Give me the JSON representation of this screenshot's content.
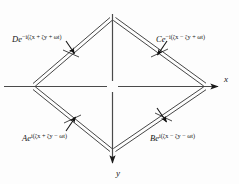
{
  "figure": {
    "background_color": "#fdfdfd",
    "ink_color": "#151515"
  },
  "axes": {
    "x": {
      "label": "x",
      "direction": "right",
      "arrow": true,
      "y_pixel": 86,
      "x_start": 4,
      "x_end": 222
    },
    "y": {
      "label": "y",
      "direction": "down",
      "arrow": true,
      "x_pixel": 112,
      "y_start": 14,
      "y_end": 166
    },
    "origin_gap": true
  },
  "waves": [
    {
      "id": "D",
      "amplitude": "De",
      "exponent_prefix": "−i(",
      "exponent": "−i(ζx + ζy + ωt)",
      "exponent_parts": {
        "sign": "−i(",
        "term1": "ζx",
        "op1": "+",
        "term2": "ζy",
        "op2": "+",
        "term3": "ωt",
        "close": ")"
      },
      "label_full": "De −i(ζx + ζy + ωt)",
      "quadrant": "top-left",
      "ray_from": [
        33,
        86
      ],
      "ray_to": [
        108,
        20
      ],
      "arrow_direction": "down-right",
      "arrow_at": [
        71,
        53
      ]
    },
    {
      "id": "C",
      "amplitude": "Ce",
      "exponent_prefix": "−i(",
      "exponent": "−i(ζx − ζy + ωt)",
      "exponent_parts": {
        "sign": "−i(",
        "term1": "ζx",
        "op1": "−",
        "term2": "ζy",
        "op2": "+",
        "term3": "ωt",
        "close": ")"
      },
      "label_full": "Ce −i(ζx − ζy + ωt)",
      "quadrant": "top-right",
      "ray_from": [
        117,
        20
      ],
      "ray_to": [
        205,
        86
      ],
      "arrow_direction": "down-left",
      "arrow_at": [
        159,
        52
      ]
    },
    {
      "id": "A",
      "amplitude": "Ae",
      "exponent_prefix": "i(",
      "exponent": "i(ζx + ζy − ωt)",
      "exponent_parts": {
        "sign": "i(",
        "term1": "ζx",
        "op1": "+",
        "term2": "ζy",
        "op2": "−",
        "term3": "ωt",
        "close": ")"
      },
      "label_full": "Ae i(ζx + ζy − ωt)",
      "quadrant": "bottom-left",
      "ray_from": [
        33,
        90
      ],
      "ray_to": [
        108,
        150
      ],
      "arrow_direction": "up-right",
      "arrow_at": [
        73,
        120
      ]
    },
    {
      "id": "B",
      "amplitude": "Be",
      "exponent_prefix": "i(",
      "exponent": "i(ζx − ζy − ωt)",
      "exponent_parts": {
        "sign": "i(",
        "term1": "ζx",
        "op1": "−",
        "term2": "ζy",
        "op2": "−",
        "term3": "ωt",
        "close": ")"
      },
      "label_full": "Be i(ζx − ζy − ωt)",
      "quadrant": "bottom-right",
      "ray_from": [
        117,
        150
      ],
      "ray_to": [
        205,
        90
      ],
      "arrow_direction": "down-left",
      "arrow_at": [
        163,
        119
      ]
    }
  ]
}
